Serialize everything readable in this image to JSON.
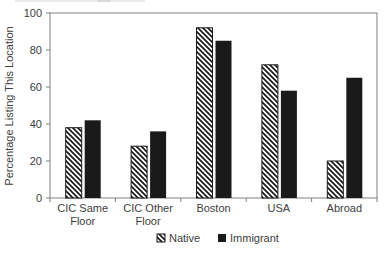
{
  "chart_data": {
    "type": "bar",
    "title": "",
    "ylabel": "Percentage Listing This Location",
    "xlabel": "",
    "ylim": [
      0,
      100
    ],
    "yticks": [
      0,
      20,
      40,
      60,
      80,
      100
    ],
    "categories": [
      "CIC Same Floor",
      "CIC Other Floor",
      "Boston",
      "USA",
      "Abroad"
    ],
    "series": [
      {
        "name": "Native",
        "style": "hatched",
        "marker": "hatched-square-icon",
        "values": [
          38,
          28,
          92,
          72,
          20
        ]
      },
      {
        "name": "Immigrant",
        "style": "solid",
        "marker": "black-square-icon",
        "values": [
          42,
          36,
          85,
          58,
          65
        ]
      }
    ],
    "legend_position": "bottom",
    "grid": false,
    "colors": {
      "bar_fill": "#1a1a1a",
      "axis": "#808080",
      "text": "#404040",
      "background": "#ffffff"
    }
  }
}
